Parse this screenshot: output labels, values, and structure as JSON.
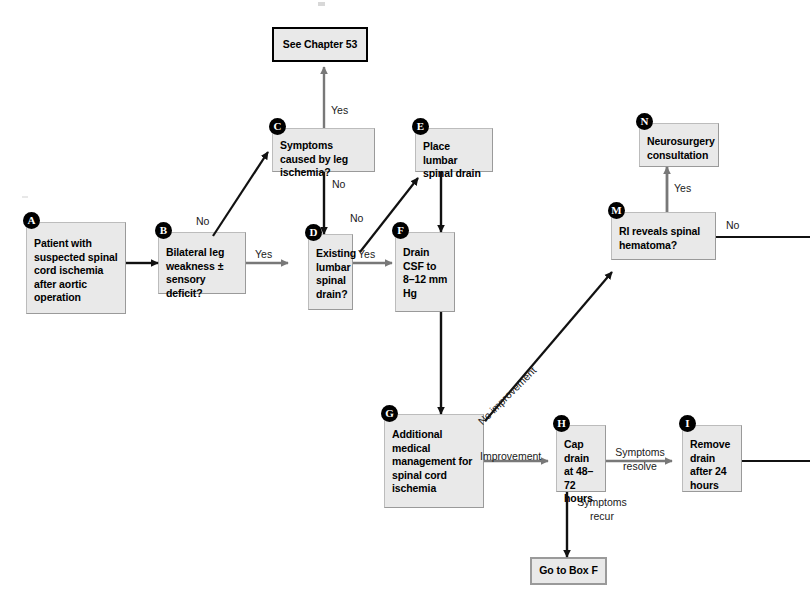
{
  "figure": {
    "type": "clinical-decision-flowchart",
    "background_color": "#ffffff",
    "box_fill": "#e9e9e9",
    "box_border": "#9a9a9a",
    "badge_fill": "#000000",
    "badge_text": "#ffffff"
  },
  "nodes": {
    "chapter_ref": {
      "label": "See Chapter 53"
    },
    "a": {
      "badge": "A",
      "label": "Patient with suspected spinal cord ischemia after aortic operation"
    },
    "b": {
      "badge": "B",
      "label": "Bilateral leg weakness ± sensory deficit?"
    },
    "c": {
      "badge": "C",
      "label": "Symptoms caused by leg ischemia?"
    },
    "d": {
      "badge": "D",
      "label": "Existing lumbar spinal drain?"
    },
    "e": {
      "badge": "E",
      "label": "Place lumbar spinal drain"
    },
    "f": {
      "badge": "F",
      "label": "Drain CSF to 8–12 mm Hg"
    },
    "g": {
      "badge": "G",
      "label": "Additional medical management for spinal cord ischemia"
    },
    "h": {
      "badge": "H",
      "label": "Cap drain at 48–72 hours"
    },
    "i": {
      "badge": "I",
      "label": "Remove drain after 24 hours"
    },
    "m": {
      "badge": "M",
      "label": "RI reveals spinal hematoma?"
    },
    "n": {
      "badge": "N",
      "label": "Neurosurgery consultation"
    },
    "go_to_box_f": {
      "label": "Go to Box F"
    }
  },
  "edge_labels": {
    "c_to_chapter": "Yes",
    "b_to_c": "No",
    "c_to_d": "No",
    "b_to_d": "Yes",
    "d_to_e": "No",
    "d_to_f": "Yes",
    "g_to_m": "No improvement",
    "g_to_h": "Improvement",
    "h_to_i": "Symptoms resolve",
    "h_to_box_f": "Symptoms recur",
    "m_to_n": "Yes",
    "m_no": "No"
  }
}
